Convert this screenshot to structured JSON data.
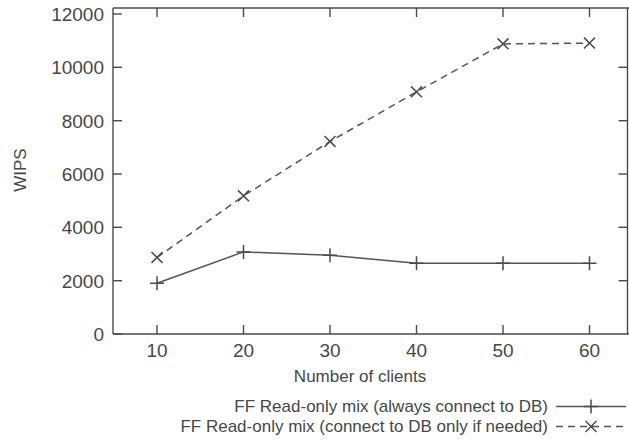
{
  "chart_data": {
    "type": "line",
    "title": "",
    "xlabel": "Number of clients",
    "ylabel": "WIPS",
    "x": [
      10,
      20,
      30,
      40,
      50,
      60
    ],
    "xticklabels": [
      "10",
      "20",
      "30",
      "40",
      "50",
      "60"
    ],
    "yticklabels": [
      "0",
      "2000",
      "4000",
      "6000",
      "8000",
      "10000",
      "12000"
    ],
    "yticks": [
      0,
      2000,
      4000,
      6000,
      8000,
      10000,
      12000
    ],
    "xlim": [
      5,
      65
    ],
    "ylim": [
      0,
      12000
    ],
    "grid": false,
    "legend_position": "below-plot",
    "series": [
      {
        "name": "FF Read-only mix (always connect to DB)",
        "values": [
          1900,
          3080,
          2950,
          2650,
          2650,
          2650
        ],
        "line_style": "solid",
        "marker": "plus",
        "color": "#555555"
      },
      {
        "name": "FF Read-only mix (connect to DB only if needed)",
        "values": [
          2870,
          5180,
          7220,
          9080,
          10880,
          10910
        ],
        "line_style": "dashed",
        "marker": "cross",
        "color": "#555555"
      }
    ]
  },
  "axes": {
    "y_label": "WIPS",
    "x_label": "Number of clients",
    "y_tick_0": "0",
    "y_tick_1": "2000",
    "y_tick_2": "4000",
    "y_tick_3": "6000",
    "y_tick_4": "8000",
    "y_tick_5": "10000",
    "y_tick_6": "12000",
    "x_tick_0": "10",
    "x_tick_1": "20",
    "x_tick_2": "30",
    "x_tick_3": "40",
    "x_tick_4": "50",
    "x_tick_5": "60"
  },
  "legend": {
    "entry_1_label": "FF Read-only mix (always connect to DB)",
    "entry_2_label": "FF Read-only mix (connect to DB only if needed)"
  }
}
